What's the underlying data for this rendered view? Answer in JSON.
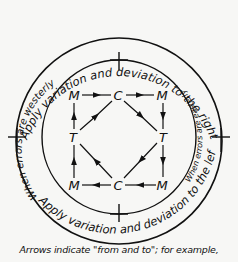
{
  "diagram": {
    "outer_top_text": "Apply variation and deviation to the right",
    "outer_bottom_text": "Apply variation and deviation to the left",
    "inner_left_text": "When errors are westerly",
    "inner_right_text": "When errors are easterly",
    "nodes": {
      "top_left": "M",
      "top_center": "C",
      "top_right": "M",
      "mid_left": "T",
      "mid_right": "T",
      "bottom_left": "M",
      "bottom_center": "C",
      "bottom_right": "M"
    },
    "arrows": [
      {
        "from": "top_left",
        "to": "top_center"
      },
      {
        "from": "top_center",
        "to": "top_right"
      },
      {
        "from": "top_right",
        "to": "mid_right"
      },
      {
        "from": "mid_right",
        "to": "bottom_right"
      },
      {
        "from": "bottom_right",
        "to": "bottom_center"
      },
      {
        "from": "bottom_center",
        "to": "bottom_left"
      },
      {
        "from": "bottom_left",
        "to": "mid_left"
      },
      {
        "from": "mid_left",
        "to": "top_left"
      },
      {
        "from": "mid_left",
        "to": "top_center"
      },
      {
        "from": "top_center",
        "to": "mid_right"
      },
      {
        "from": "mid_right",
        "to": "bottom_center"
      },
      {
        "from": "bottom_center",
        "to": "mid_left"
      }
    ]
  },
  "caption": "Arrows indicate \"from and to\"; for example,"
}
